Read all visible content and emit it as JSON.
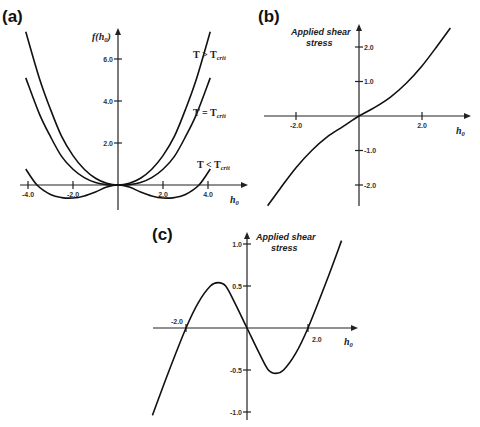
{
  "chart_data": [
    {
      "panel": "(a)",
      "type": "line",
      "xlabel": "h0",
      "ylabel": "f(h0)",
      "x_ticks": [
        "-4.0",
        "-2.0",
        "2.0",
        "4.0"
      ],
      "y_ticks": [
        "2.0",
        "4.0",
        "6.0"
      ],
      "xlim": [
        -4.1,
        4.1
      ],
      "ylim": [
        -0.8,
        7.5
      ],
      "series": [
        {
          "name": "T > Tcrit",
          "label_main": "T > T",
          "label_sub": "crit",
          "points": [
            [
              -4.1,
              7.3
            ],
            [
              -3.5,
              5.1
            ],
            [
              -3,
              3.6
            ],
            [
              -2.5,
              2.3
            ],
            [
              -2,
              1.4
            ],
            [
              -1.5,
              0.75
            ],
            [
              -1,
              0.32
            ],
            [
              -0.5,
              0.08
            ],
            [
              0,
              0
            ],
            [
              0.5,
              0.08
            ],
            [
              1,
              0.32
            ],
            [
              1.5,
              0.75
            ],
            [
              2,
              1.4
            ],
            [
              2.5,
              2.3
            ],
            [
              3,
              3.6
            ],
            [
              3.5,
              5.1
            ],
            [
              4.1,
              7.3
            ]
          ]
        },
        {
          "name": "T = Tcrit",
          "label_main": "T = T",
          "label_sub": "crit",
          "points": [
            [
              -4.1,
              5.1
            ],
            [
              -3.5,
              3.4
            ],
            [
              -3,
              2.3
            ],
            [
              -2.5,
              1.35
            ],
            [
              -2,
              0.75
            ],
            [
              -1.5,
              0.35
            ],
            [
              -1,
              0.12
            ],
            [
              -0.5,
              0.02
            ],
            [
              0,
              0
            ],
            [
              0.5,
              0.02
            ],
            [
              1,
              0.12
            ],
            [
              1.5,
              0.35
            ],
            [
              2,
              0.75
            ],
            [
              2.5,
              1.35
            ],
            [
              3,
              2.3
            ],
            [
              3.5,
              3.4
            ],
            [
              4.1,
              5.1
            ]
          ]
        },
        {
          "name": "T < Tcrit",
          "label_main": "T < T",
          "label_sub": "crit",
          "points": [
            [
              -4.1,
              0.76
            ],
            [
              -3.6,
              0
            ],
            [
              -3,
              -0.45
            ],
            [
              -2.5,
              -0.6
            ],
            [
              -2,
              -0.62
            ],
            [
              -1.5,
              -0.52
            ],
            [
              -1,
              -0.33
            ],
            [
              -0.5,
              -0.1
            ],
            [
              0,
              0
            ],
            [
              0.5,
              -0.1
            ],
            [
              1,
              -0.33
            ],
            [
              1.5,
              -0.52
            ],
            [
              2,
              -0.62
            ],
            [
              2.5,
              -0.6
            ],
            [
              3,
              -0.45
            ],
            [
              3.6,
              0
            ],
            [
              4.1,
              0.76
            ]
          ]
        }
      ]
    },
    {
      "panel": "(b)",
      "type": "line",
      "xlabel": "h0",
      "ylabel": "Applied shear stress",
      "ylabel_lines": [
        "Applied shear",
        "stress"
      ],
      "x_ticks": [
        "-2.0",
        "2.0"
      ],
      "y_ticks": [
        "2.0",
        "1.0",
        "-1.0",
        "-2.0"
      ],
      "xlim": [
        -2.9,
        2.9
      ],
      "ylim": [
        -2.6,
        2.6
      ],
      "series": [
        {
          "name": "shear stress",
          "points": [
            [
              -2.9,
              -2.6
            ],
            [
              -2.5,
              -2.1
            ],
            [
              -2,
              -1.5
            ],
            [
              -1.5,
              -1.0
            ],
            [
              -1,
              -0.6
            ],
            [
              -0.5,
              -0.3
            ],
            [
              0,
              0
            ],
            [
              0.5,
              0.25
            ],
            [
              1,
              0.55
            ],
            [
              1.5,
              0.95
            ],
            [
              2,
              1.45
            ],
            [
              2.5,
              2.05
            ],
            [
              2.9,
              2.55
            ]
          ]
        }
      ]
    },
    {
      "panel": "(c)",
      "type": "line",
      "xlabel": "h0",
      "ylabel": "Applied shear stress",
      "ylabel_lines": [
        "Applied shear",
        "stress"
      ],
      "x_ticks": [
        "-2.0",
        "2.0"
      ],
      "y_ticks": [
        "1.0",
        "0.5",
        "-0.5",
        "-1.0"
      ],
      "xlim": [
        -3.1,
        3.1
      ],
      "ylim": [
        -1.05,
        1.05
      ],
      "series": [
        {
          "name": "shear stress",
          "points": [
            [
              -3.1,
              -1.04
            ],
            [
              -2.6,
              -0.55
            ],
            [
              -2.0,
              0
            ],
            [
              -1.6,
              0.3
            ],
            [
              -1.2,
              0.5
            ],
            [
              -0.95,
              0.54
            ],
            [
              -0.7,
              0.5
            ],
            [
              -0.4,
              0.3
            ],
            [
              0,
              0
            ],
            [
              0.4,
              -0.3
            ],
            [
              0.7,
              -0.5
            ],
            [
              0.95,
              -0.54
            ],
            [
              1.2,
              -0.5
            ],
            [
              1.6,
              -0.3
            ],
            [
              2.0,
              0
            ],
            [
              2.6,
              0.55
            ],
            [
              3.1,
              1.04
            ]
          ]
        }
      ]
    }
  ],
  "panels": {
    "a": {
      "label": "(a)",
      "ylabel_f": "f(h",
      "ylabel_sub": "0",
      "ylabel_close": ")",
      "xlabel": "h",
      "xlabel_sub": "0"
    },
    "b": {
      "label": "(b)",
      "title1": "Applied shear",
      "title2": "stress",
      "xlabel": "h",
      "xlabel_sub": "0"
    },
    "c": {
      "label": "(c)",
      "title1": "Applied shear",
      "title2": "stress",
      "xlabel": "h",
      "xlabel_sub": "0"
    }
  }
}
